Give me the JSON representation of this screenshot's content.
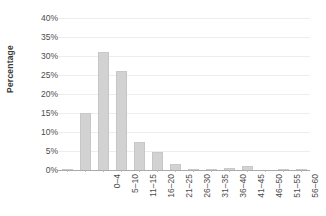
{
  "chart_data": {
    "type": "bar",
    "title": "",
    "xlabel": "",
    "ylabel": "Percentage",
    "ylim": [
      0,
      40
    ],
    "ytick_labels": [
      "40%",
      "35%",
      "30%",
      "25%",
      "20%",
      "15%",
      "10%",
      "5%",
      "0%"
    ],
    "ytick_values": [
      40,
      35,
      30,
      25,
      20,
      15,
      10,
      5,
      0
    ],
    "grid": true,
    "legend": "none",
    "categories": [
      "0–4",
      "5–10",
      "11–15",
      "16–20",
      "21–25",
      "26–30",
      "31–35",
      "36–40",
      "41–45",
      "46–50",
      "51–55",
      "56–60",
      "61–65",
      "65+"
    ],
    "values": [
      0.3,
      15.0,
      31.0,
      26.0,
      7.5,
      4.8,
      1.6,
      0.3,
      0.35,
      0.6,
      1.1,
      0.0,
      0.25,
      0.2
    ],
    "bar_color": "#d2d2d2",
    "gridline_color": "#ededed",
    "axis_color": "#a9a9a9",
    "text_color": "#4d4d4d"
  }
}
